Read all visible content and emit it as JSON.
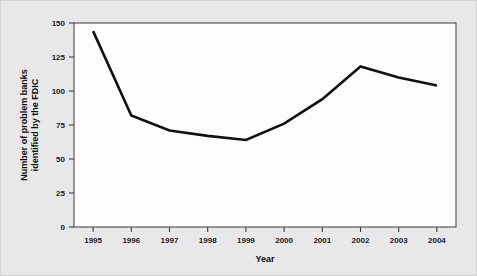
{
  "figure": {
    "background_color": "#e8e8e8",
    "plot_background_color": "#fdfdfd",
    "line_color": "#111111",
    "axis_color": "#4a4a4a"
  },
  "chart_data": {
    "type": "line",
    "title": "",
    "subtitle": "",
    "xlabel": "Year",
    "ylabel": "Number of problem banks identified by the FDIC",
    "ylabel_line1": "Number of problem banks",
    "ylabel_line2": "identified by the FDIC",
    "categories": [
      "1995",
      "1996",
      "1997",
      "1998",
      "1999",
      "2000",
      "2001",
      "2002",
      "2003",
      "2004"
    ],
    "x": [
      1995,
      1996,
      1997,
      1998,
      1999,
      2000,
      2001,
      2002,
      2003,
      2004
    ],
    "values": [
      144,
      82,
      71,
      67,
      64,
      76,
      94,
      118,
      110,
      104
    ],
    "series": [
      {
        "name": "Number of problem banks identified by the FDIC",
        "values": [
          144,
          82,
          71,
          67,
          64,
          76,
          94,
          118,
          110,
          104
        ]
      }
    ],
    "ylim": [
      0,
      150
    ],
    "xlim": [
      1994.5,
      2004.5
    ],
    "yticks": [
      0,
      25,
      50,
      75,
      100,
      125,
      150
    ],
    "ytick_labels": [
      "0",
      "25",
      "50",
      "75",
      "100",
      "125",
      "150"
    ],
    "xtick_labels": [
      "1995",
      "1996",
      "1997",
      "1998",
      "1999",
      "2000",
      "2001",
      "2002",
      "2003",
      "2004"
    ],
    "grid": false,
    "legend": false,
    "legend_position": "none"
  }
}
